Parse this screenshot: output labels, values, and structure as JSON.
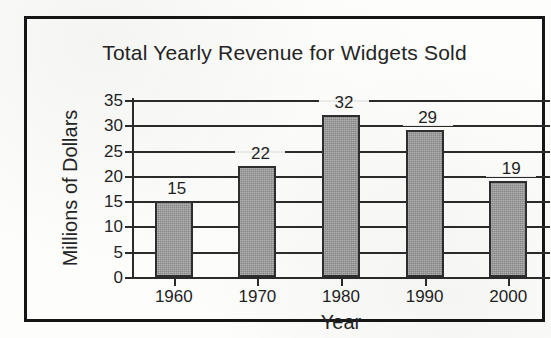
{
  "chart_data": {
    "type": "bar",
    "title": "Total Yearly Revenue for Widgets Sold",
    "xlabel": "Year",
    "ylabel": "Millions of Dollars",
    "categories": [
      "1960",
      "1970",
      "1980",
      "1990",
      "2000"
    ],
    "values": [
      15,
      22,
      32,
      29,
      19
    ],
    "value_labels": [
      "15",
      "22",
      "32",
      "29",
      "19"
    ],
    "ylim": [
      0,
      35
    ],
    "yticks": [
      35,
      30,
      25,
      20,
      15,
      10,
      5,
      0
    ],
    "ytick_labels": [
      "35",
      "30",
      "25",
      "20",
      "15",
      "10",
      "5",
      "0"
    ],
    "grid": "horizontal",
    "legend": "none",
    "series": [
      {
        "name": "Total Yearly Revenue",
        "values": [
          15,
          22,
          32,
          29,
          19
        ]
      }
    ],
    "colors": {
      "bar_fill": "#9d9d9d",
      "bar_edge": "#2e2e2e",
      "grid": "#2b2b2b",
      "text": "#1f1f1f",
      "frame": "#161616",
      "background": "#fdfdfc"
    }
  },
  "frame": {
    "style": "solid-black-rectangle-border"
  }
}
